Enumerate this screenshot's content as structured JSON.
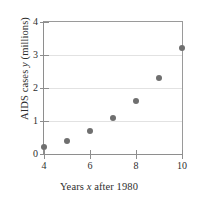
{
  "chart_data": {
    "type": "scatter",
    "title": "",
    "xlabel": "Years x after 1980",
    "xlabel_prefix": "Years ",
    "xlabel_italic": "x",
    "xlabel_suffix": " after 1980",
    "ylabel": "AIDS cases y (millions)",
    "ylabel_prefix": "AIDS cases ",
    "ylabel_italic": "y",
    "ylabel_suffix": " (millions)",
    "x": [
      4,
      5,
      6,
      7,
      8,
      9,
      10
    ],
    "values": [
      0.2,
      0.4,
      0.7,
      1.1,
      1.6,
      2.3,
      3.2
    ],
    "points": [
      {
        "x": 4,
        "y": 0.2
      },
      {
        "x": 5,
        "y": 0.4
      },
      {
        "x": 6,
        "y": 0.7
      },
      {
        "x": 7,
        "y": 1.1
      },
      {
        "x": 8,
        "y": 1.6
      },
      {
        "x": 9,
        "y": 2.3
      },
      {
        "x": 10,
        "y": 3.2
      }
    ],
    "xlim": [
      4,
      10
    ],
    "ylim": [
      0,
      4
    ],
    "xticks": [
      4,
      6,
      8,
      10
    ],
    "xtick_labels": [
      "4",
      "6",
      "8",
      "10"
    ],
    "yticks": [
      0,
      1,
      2,
      3,
      4
    ],
    "ytick_labels": [
      "0",
      "1",
      "2",
      "3",
      "4"
    ],
    "grid": true,
    "grid_axis": "y",
    "legend": false,
    "marker_color": "#6f6f6f",
    "grid_color": "#e2e2e2",
    "axis_color": "#8e8e8e",
    "background": "#ffffff"
  }
}
